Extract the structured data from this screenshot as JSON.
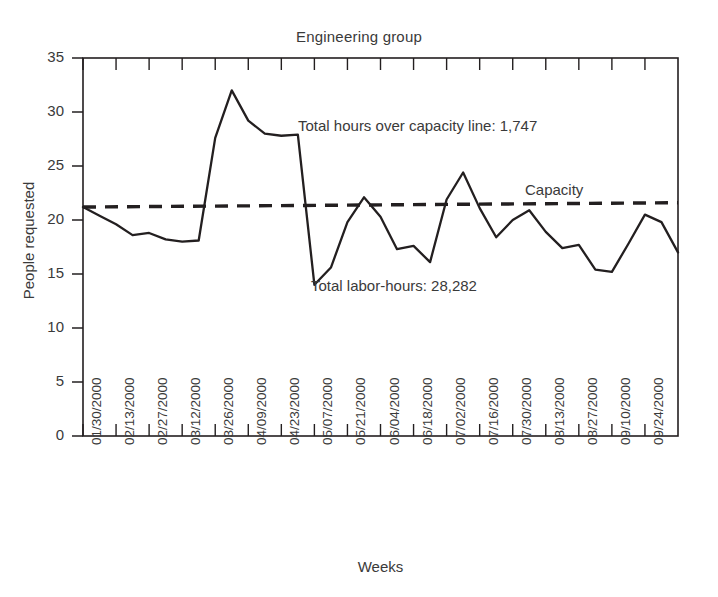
{
  "chart_data": {
    "type": "line",
    "title": "Engineering group",
    "xlabel": "Weeks",
    "ylabel": "People requested",
    "ylim": [
      0,
      35
    ],
    "ytick_values": [
      0,
      5,
      10,
      15,
      20,
      25,
      30,
      35
    ],
    "ytick_labels": [
      "0",
      "5",
      "10",
      "15",
      "20",
      "25",
      "30",
      "35"
    ],
    "grid": false,
    "legend": "none",
    "xtick_labels": [
      "01/30/2000",
      "02/13/2000",
      "02/27/2000",
      "03/12/2000",
      "03/26/2000",
      "04/09/2000",
      "04/23/2000",
      "05/07/2000",
      "05/21/2000",
      "06/04/2000",
      "06/18/2000",
      "07/02/2000",
      "07/16/2000",
      "07/30/2000",
      "08/13/2000",
      "08/27/2000",
      "09/10/2000",
      "09/24/2000"
    ],
    "series": [
      {
        "name": "People requested",
        "style": "solid",
        "color": "#231f20",
        "values": [
          21.2,
          20.4,
          19.6,
          18.6,
          18.8,
          18.2,
          18.0,
          18.1,
          27.6,
          32.0,
          29.2,
          28.0,
          27.8,
          27.9,
          14.0,
          15.6,
          19.8,
          22.1,
          20.3,
          17.3,
          17.6,
          16.1,
          21.9,
          24.4,
          21.1,
          18.4,
          20.0,
          20.9,
          18.9,
          17.4,
          17.7,
          15.4,
          15.2,
          17.8,
          20.5,
          19.8,
          17.0
        ]
      },
      {
        "name": "Capacity",
        "style": "dashed",
        "color": "#231f20",
        "values": [
          21.2,
          21.6
        ],
        "note": "near-horizontal reference line, slight upward slope"
      }
    ],
    "annotations": [
      {
        "text": "Total hours over capacity line: 1,747",
        "x_frac": 0.36,
        "y_value": 27.5
      },
      {
        "text": "Total labor-hours: 28,282",
        "x_frac": 0.39,
        "y_value": 13.5
      },
      {
        "text": "Capacity",
        "x_frac": 0.74,
        "y_value": 23.0
      }
    ]
  },
  "colors": {
    "ink": "#231f20",
    "text": "#3a3a3a",
    "background": "#ffffff"
  }
}
